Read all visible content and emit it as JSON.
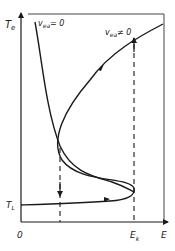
{
  "diagram": {
    "y_axis_label": "T",
    "y_axis_label_sub": "e",
    "x_axis_label": "E",
    "origin_label": "0",
    "low_temp_label": "T",
    "low_temp_label_sub": "L",
    "critical_field_label": "E",
    "critical_field_label_sub": "k",
    "curve_zero_label": "v",
    "curve_zero_label_sub": "ea",
    "curve_zero_label_rel": "= 0",
    "curve_nonzero_label": "v",
    "curve_nonzero_label_sub": "ea",
    "curve_nonzero_label_rel": "≠ 0",
    "colors": {
      "ink": "#1a1a1a",
      "background": "#ffffff"
    }
  }
}
